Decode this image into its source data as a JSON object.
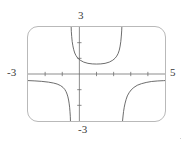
{
  "figure": {
    "kind": "graphing-calculator-screen",
    "frame_color": "#b9b9b9",
    "curve_color": "#595959",
    "axis_color": "#6e6e6e",
    "background": "#ffffff"
  },
  "labels": {
    "y_max": "3",
    "y_min": "-3",
    "x_min": "-3",
    "x_max": "5"
  },
  "chart_data": {
    "type": "line",
    "title": "",
    "xlabel": "",
    "ylabel": "",
    "xlim": [
      -3,
      5
    ],
    "ylim": [
      -3,
      3
    ],
    "grid": false,
    "x_tick_labels": [
      "-3",
      "5"
    ],
    "y_tick_labels": [
      "3",
      "-3"
    ],
    "x_ticks": [
      -2,
      -1,
      0,
      1,
      2,
      3,
      4
    ],
    "y_ticks": [
      -2,
      -1,
      0,
      1,
      2
    ],
    "tick_spacing": 1,
    "asymptotes": {
      "vertical": [
        -0.5,
        2.5
      ]
    },
    "legend": null,
    "annotations": [],
    "series": [
      {
        "name": "branch-lower-left",
        "comment": "descending branch from left edge down to vertical asymptote x = -0.5",
        "x": [
          -3.0,
          -2.6,
          -2.2,
          -1.8,
          -1.5,
          -1.3,
          -1.1,
          -0.95,
          -0.85,
          -0.78,
          -0.72,
          -0.67,
          -0.63,
          -0.6,
          -0.57,
          -0.55,
          -0.53,
          -0.52
        ],
        "y": [
          -0.42,
          -0.44,
          -0.47,
          -0.52,
          -0.58,
          -0.64,
          -0.74,
          -0.86,
          -0.99,
          -1.12,
          -1.28,
          -1.46,
          -1.66,
          -1.86,
          -2.12,
          -2.38,
          -2.7,
          -3.0
        ]
      },
      {
        "name": "branch-upper-middle",
        "comment": "U shaped branch between the two vertical asymptotes, minimum near x = 1",
        "x": [
          -0.48,
          -0.47,
          -0.45,
          -0.42,
          -0.38,
          -0.33,
          -0.27,
          -0.2,
          -0.1,
          0.05,
          0.25,
          0.5,
          0.75,
          1.0,
          1.25,
          1.5,
          1.75,
          1.95,
          2.08,
          2.18,
          2.26,
          2.33,
          2.38,
          2.42,
          2.45,
          2.47,
          2.48
        ],
        "y": [
          3.0,
          2.72,
          2.4,
          2.08,
          1.8,
          1.55,
          1.34,
          1.18,
          1.02,
          0.88,
          0.76,
          0.68,
          0.645,
          0.635,
          0.645,
          0.68,
          0.76,
          0.88,
          1.0,
          1.14,
          1.3,
          1.52,
          1.78,
          2.08,
          2.42,
          2.75,
          3.0
        ]
      },
      {
        "name": "branch-lower-right",
        "comment": "branch rising from vertical asymptote x = 2.5 then flattening toward right edge",
        "x": [
          2.52,
          2.55,
          2.58,
          2.62,
          2.67,
          2.73,
          2.8,
          2.9,
          3.02,
          3.18,
          3.38,
          3.62,
          3.9,
          4.2,
          4.55,
          4.9,
          5.0
        ],
        "y": [
          -3.0,
          -2.68,
          -2.4,
          -2.12,
          -1.86,
          -1.62,
          -1.4,
          -1.2,
          -1.02,
          -0.86,
          -0.72,
          -0.62,
          -0.54,
          -0.48,
          -0.445,
          -0.425,
          -0.42
        ]
      }
    ]
  }
}
